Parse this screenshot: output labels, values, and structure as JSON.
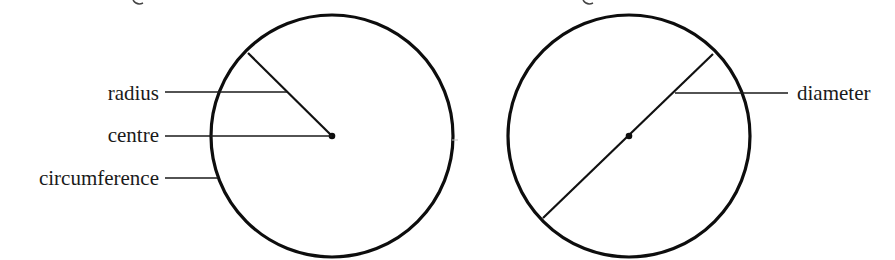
{
  "figure": {
    "type": "circle-parts-diagram",
    "colors": {
      "background": "#ffffff",
      "ink": "#0d0d0d"
    },
    "left_circle": {
      "center": [
        332,
        136
      ],
      "radius": 121,
      "radius_line": {
        "from": [
          248,
          53
        ],
        "to": [
          332,
          136
        ]
      },
      "labels": [
        {
          "id": "radius",
          "text": "radius",
          "text_anchor_x": 159,
          "baseline_y": 100,
          "leader": {
            "x1": 165,
            "x2": 287,
            "y": 92
          }
        },
        {
          "id": "centre",
          "text": "centre",
          "text_anchor_x": 159,
          "baseline_y": 142,
          "leader": {
            "x1": 165,
            "x2": 332,
            "y": 136
          }
        },
        {
          "id": "circumference",
          "text": "circumference",
          "text_anchor_x": 159,
          "baseline_y": 185,
          "leader": {
            "x1": 165,
            "x2": 218,
            "y": 178
          }
        }
      ]
    },
    "right_circle": {
      "center": [
        629,
        136
      ],
      "radius": 121,
      "diameter_line": {
        "from": [
          713,
          54
        ],
        "to": [
          543,
          218
        ]
      },
      "labels": [
        {
          "id": "diameter",
          "text": "diameter",
          "text_anchor_x": 797,
          "baseline_y": 100,
          "leader": {
            "x1": 675,
            "x2": 788,
            "y": 93
          }
        }
      ]
    }
  }
}
